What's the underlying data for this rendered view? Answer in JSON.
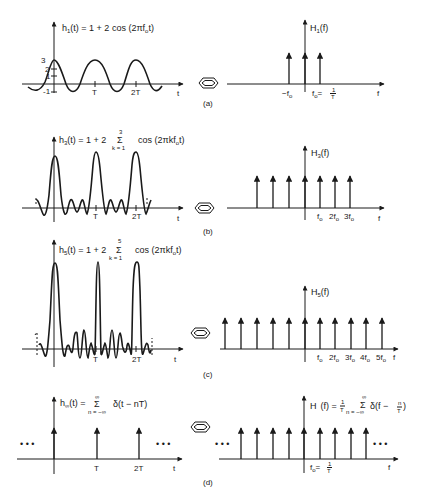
{
  "figure": {
    "panels": [
      {
        "caption": "(a)",
        "time": {
          "func": "h",
          "sub": "1",
          "eq_rest": "(t) = 1 + 2 cos (2πf",
          "eq_sub": "o",
          "eq_end": "t)",
          "y_ticks": [
            "3",
            "2",
            "1",
            "-1"
          ],
          "x_ticks": [
            "T",
            "2T"
          ],
          "axis_label": "t"
        },
        "freq": {
          "func": "H",
          "sub": "1",
          "eq_end": "(f)",
          "x_ticks": [
            "−f",
            "f",
            "= ",
            "1",
            "T"
          ],
          "axis_label": "f"
        }
      },
      {
        "caption": "(b)",
        "time": {
          "func": "h",
          "sub": "3",
          "eq_rest": "(t) = 1 + 2",
          "sum_top": "3",
          "sum_sym": "Σ",
          "sum_bottom": "k = 1",
          "eq_tail": "cos (2πkf",
          "eq_sub": "o",
          "eq_end": "t)",
          "x_ticks": [
            "T",
            "2T"
          ],
          "axis_label": "t"
        },
        "freq": {
          "func": "H",
          "sub": "3",
          "eq_end": "(f)",
          "x_ticks": [
            "f",
            "2f",
            "3f"
          ],
          "axis_label": "f"
        }
      },
      {
        "caption": "(c)",
        "time": {
          "func": "h",
          "sub": "5",
          "eq_rest": "(t) = 1 + 2",
          "sum_top": "5",
          "sum_sym": "Σ",
          "sum_bottom": "k = 1",
          "eq_tail": "cos (2πkf",
          "eq_sub": "o",
          "eq_end": "t)",
          "x_ticks": [
            "T",
            "2T"
          ],
          "axis_label": "t"
        },
        "freq": {
          "func": "H",
          "sub": "5",
          "eq_end": "(f)",
          "x_ticks": [
            "f",
            "2f",
            "3f",
            "4f",
            "5f"
          ],
          "axis_label": "f"
        }
      },
      {
        "caption": "(d)",
        "time": {
          "func": "h",
          "sub": "∞",
          "eq_rest": "(t) =",
          "sum_top": "∞",
          "sum_sym": "Σ",
          "sum_bottom": "n = −∞",
          "eq_tail": "δ(t − nT)",
          "x_ticks": [
            "T",
            "2T"
          ],
          "axis_label": "t",
          "ellipsis": "• • •"
        },
        "freq": {
          "func": "H",
          "eq_pre": "(f) =",
          "frac_num": "1",
          "frac_den": "T",
          "sum_top": "∞",
          "sum_sym": "Σ",
          "sum_bottom": "n = −∞",
          "eq_tail": "δ(f −",
          "eq_frac_num": "n",
          "eq_frac_den": "T",
          "eq_close": ")",
          "x_ticks": [
            "f",
            "= ",
            "1",
            "T"
          ],
          "axis_label": "f",
          "ellipsis": "• • •"
        }
      }
    ],
    "subscript_o": "o",
    "equivalence_icon": "fourier-pair-hexagon-icon"
  }
}
